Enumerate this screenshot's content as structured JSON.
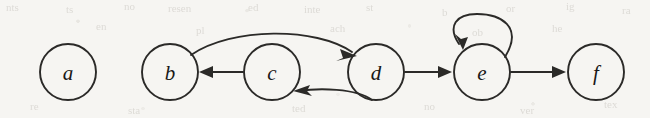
{
  "figure": {
    "kind": "directed-graph-diagram",
    "background_color": "#f6f5f2",
    "stroke_color": "#2b2a28",
    "label_color": "#191817",
    "node_radius": 28,
    "nodes": [
      {
        "id": "a",
        "label": "a",
        "cx": 68,
        "cy": 72
      },
      {
        "id": "b",
        "label": "b",
        "cx": 170,
        "cy": 72
      },
      {
        "id": "c",
        "label": "c",
        "cx": 272,
        "cy": 72
      },
      {
        "id": "d",
        "label": "d",
        "cx": 376,
        "cy": 72
      },
      {
        "id": "e",
        "label": "e",
        "cx": 482,
        "cy": 72
      },
      {
        "id": "f",
        "label": "f",
        "cx": 596,
        "cy": 72
      }
    ],
    "edges": [
      {
        "id": "b-to-d",
        "from": "b",
        "to": "d",
        "style": "curved-above",
        "directed": true
      },
      {
        "id": "c-to-b",
        "from": "c",
        "to": "b",
        "style": "straight",
        "directed": true
      },
      {
        "id": "d-to-c",
        "from": "d",
        "to": "c",
        "style": "curved-below",
        "directed": true
      },
      {
        "id": "d-to-e",
        "from": "d",
        "to": "e",
        "style": "straight",
        "directed": true
      },
      {
        "id": "e-to-e",
        "from": "e",
        "to": "e",
        "style": "self-loop-top",
        "directed": true
      },
      {
        "id": "e-to-f",
        "from": "e",
        "to": "f",
        "style": "straight",
        "directed": true
      }
    ],
    "ghost_marks": [
      {
        "text": "nts",
        "x": 6,
        "y": 1
      },
      {
        "text": "ts",
        "x": 66,
        "y": 3
      },
      {
        "text": "no",
        "x": 124,
        "y": 0
      },
      {
        "text": "resen",
        "x": 168,
        "y": 2
      },
      {
        "text": "ed",
        "x": 248,
        "y": 1
      },
      {
        "text": "inte",
        "x": 304,
        "y": 3
      },
      {
        "text": "st",
        "x": 366,
        "y": 1
      },
      {
        "text": "b",
        "x": 442,
        "y": 6
      },
      {
        "text": "or",
        "x": 506,
        "y": 2
      },
      {
        "text": "ig",
        "x": 566,
        "y": 0
      },
      {
        "text": "ra",
        "x": 622,
        "y": 4
      },
      {
        "text": "en",
        "x": 96,
        "y": 20
      },
      {
        "text": "pl",
        "x": 196,
        "y": 24
      },
      {
        "text": "ach",
        "x": 330,
        "y": 22
      },
      {
        "text": "ob",
        "x": 472,
        "y": 26
      },
      {
        "text": "he",
        "x": 552,
        "y": 22
      },
      {
        "text": "re",
        "x": 30,
        "y": 100
      },
      {
        "text": "sta",
        "x": 128,
        "y": 104
      },
      {
        "text": "ted",
        "x": 292,
        "y": 102
      },
      {
        "text": "no",
        "x": 424,
        "y": 100
      },
      {
        "text": "ver",
        "x": 520,
        "y": 104
      },
      {
        "text": "tex",
        "x": 604,
        "y": 98
      }
    ]
  }
}
